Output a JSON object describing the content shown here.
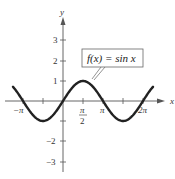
{
  "chart_data": {
    "type": "line",
    "title": "",
    "function": "sin x",
    "annotation": "f(x) = sin x",
    "xlabel": "x",
    "ylabel": "y",
    "x_ticks": [
      "-π",
      "π/2",
      "π",
      "2π"
    ],
    "x_tick_values": [
      -3.1416,
      1.5708,
      3.1416,
      6.2832
    ],
    "y_ticks": [
      "-3",
      "-2",
      "1",
      "2",
      "3"
    ],
    "y_tick_values": [
      -3,
      -2,
      1,
      2,
      3
    ],
    "xlim": [
      -4.1,
      7.8
    ],
    "ylim": [
      -3.5,
      4.0
    ],
    "grid": false,
    "series": [
      {
        "name": "f(x) = sin x",
        "x": [
          -3.93,
          -3.1416,
          -1.5708,
          0,
          1.5708,
          3.1416,
          4.7124,
          6.2832,
          7.07
        ],
        "y": [
          0.707,
          0,
          -1,
          0,
          1,
          0,
          -1,
          0,
          0.707
        ]
      }
    ]
  },
  "labels": {
    "x_axis": "x",
    "y_axis": "y",
    "annotation_box": "f(x) = sin x",
    "tick_neg_pi": "−π",
    "tick_pi_num": "π",
    "tick_pi_den": "2",
    "tick_pi": "π",
    "tick_2pi": "2π",
    "tick_y1": "1",
    "tick_y2": "2",
    "tick_y3": "3",
    "tick_yneg2": "−2",
    "tick_yneg3": "−3"
  },
  "colors": {
    "axis": "#555555",
    "curve": "#222222",
    "box_border": "#666666"
  }
}
